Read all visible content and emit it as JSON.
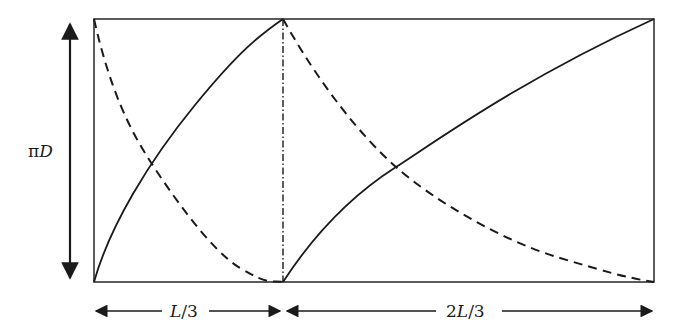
{
  "diagram": {
    "type": "unrolled-cylinder-flow-schematic",
    "labels": {
      "height": "πD",
      "height_pi": "π",
      "height_var": "D",
      "segment1": "L/3",
      "segment1_var": "L",
      "segment1_rest": "/3",
      "segment2": "2L/3",
      "segment2_pre": "2",
      "segment2_var": "L",
      "segment2_rest": "/3"
    },
    "geometry": {
      "rect": {
        "left": 94,
        "top": 19,
        "right": 654,
        "bottom": 282
      },
      "divider_x": 283,
      "vertical_arrow_x": 70,
      "bottom_arrow_y": 311
    },
    "curves": [
      {
        "name": "solid-curve-section1",
        "style": "solid",
        "from": [
          94,
          282
        ],
        "to": [
          283,
          19
        ],
        "crosses_at": [
          150,
          161
        ]
      },
      {
        "name": "dashed-curve-section1",
        "style": "dashed",
        "from": [
          94,
          19
        ],
        "to": [
          283,
          282
        ],
        "crosses_at": [
          150,
          161
        ]
      },
      {
        "name": "solid-curve-section2",
        "style": "solid",
        "from": [
          283,
          282
        ],
        "to": [
          654,
          19
        ],
        "crosses_at": [
          396,
          167
        ]
      },
      {
        "name": "dashed-curve-section2",
        "style": "dashed",
        "from": [
          283,
          19
        ],
        "to": [
          654,
          282
        ],
        "crosses_at": [
          396,
          167
        ]
      }
    ],
    "colors": {
      "stroke": "#1a1a1a",
      "frame": "#333333",
      "background": "#ffffff"
    }
  }
}
